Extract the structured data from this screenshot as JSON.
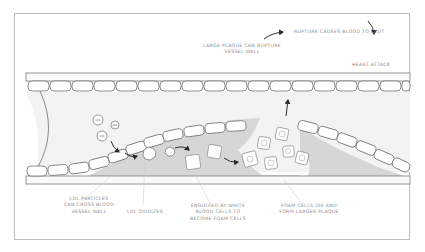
{
  "diagram": {
    "type": "atherosclerosis-process",
    "colors": {
      "frame": "#bdbdbd",
      "wall_stroke": "#6e6e6e",
      "cell_fill": "#ffffff",
      "lumen_fill": "#f2f2f2",
      "plaque_fill": "#d4d4d4",
      "arrow": "#2b2b2b",
      "label_text": "#8a8a8a"
    },
    "particles": {
      "ldl_label": "LDL"
    },
    "labels": {
      "rupture_clot": "RUPTURE CAUSES BLOOD TO CLOT",
      "heart_attack": "HEART ATTACK",
      "large_plaque": "LARGE PLAQUE CAN RUPTURE\nVESSEL WALL",
      "ldl_cross": "LDL PARTICLES\nCAN CROSS BLOOD\nVESSEL WALL",
      "ldl_oxidizes": "LDL OXIDIZES",
      "engulfed": "ENGULFED BY WHITE\nBLOOD CELLS TO\nBECOME FOAM CELLS",
      "foam_cells": "FOAM CELLS DIE AND\nFORM LARGER PLAQUE"
    }
  }
}
